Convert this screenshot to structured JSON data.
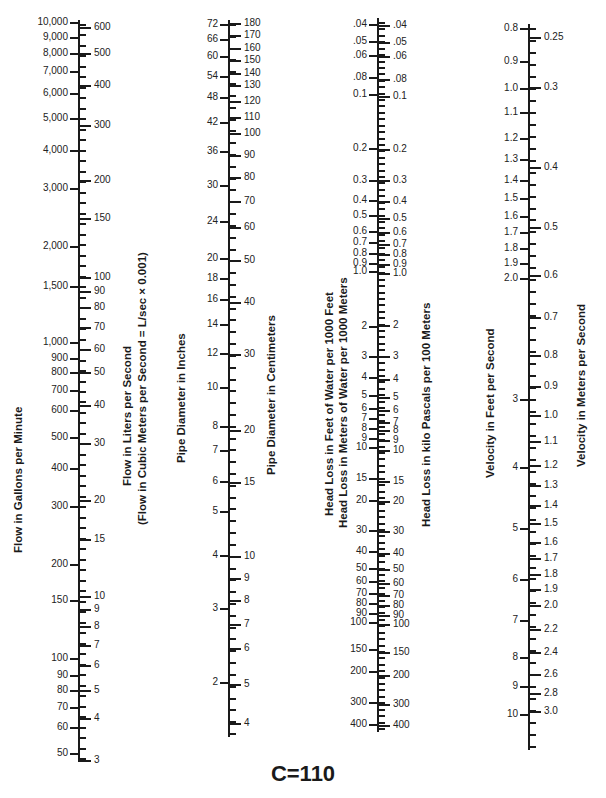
{
  "title": "C=110",
  "axes": [
    {
      "id": "flow",
      "x": 79,
      "top": 20,
      "bottom": 762,
      "left_title": "Flow in Gallons per Minute",
      "right_title": [
        "Flow in Liters per Second",
        "(Flow in Cubic Meters per Second = L/sec × 0.001)"
      ],
      "left_labels": [
        {
          "t": "10,000",
          "y": 22
        },
        {
          "t": "9,000",
          "y": 37
        },
        {
          "t": "8,000",
          "y": 53
        },
        {
          "t": "7,000",
          "y": 71
        },
        {
          "t": "6,000",
          "y": 93
        },
        {
          "t": "5,000",
          "y": 118
        },
        {
          "t": "4,000",
          "y": 150
        },
        {
          "t": "3,000",
          "y": 188
        },
        {
          "t": "2,000",
          "y": 246
        },
        {
          "t": "1,500",
          "y": 286
        },
        {
          "t": "1,000",
          "y": 342
        },
        {
          "t": "900",
          "y": 358
        },
        {
          "t": "800",
          "y": 372
        },
        {
          "t": "700",
          "y": 390
        },
        {
          "t": "600",
          "y": 410
        },
        {
          "t": "500",
          "y": 437
        },
        {
          "t": "400",
          "y": 468
        },
        {
          "t": "300",
          "y": 506
        },
        {
          "t": "200",
          "y": 564
        },
        {
          "t": "150",
          "y": 600
        },
        {
          "t": "100",
          "y": 658
        },
        {
          "t": "90",
          "y": 675
        },
        {
          "t": "80",
          "y": 690
        },
        {
          "t": "70",
          "y": 707
        },
        {
          "t": "60",
          "y": 727
        },
        {
          "t": "50",
          "y": 753
        }
      ],
      "right_labels": [
        {
          "t": "600",
          "y": 27
        },
        {
          "t": "500",
          "y": 53
        },
        {
          "t": "400",
          "y": 85
        },
        {
          "t": "300",
          "y": 125
        },
        {
          "t": "200",
          "y": 180
        },
        {
          "t": "150",
          "y": 218
        },
        {
          "t": "100",
          "y": 277
        },
        {
          "t": "90",
          "y": 291
        },
        {
          "t": "80",
          "y": 307
        },
        {
          "t": "70",
          "y": 327
        },
        {
          "t": "60",
          "y": 349
        },
        {
          "t": "50",
          "y": 372
        },
        {
          "t": "40",
          "y": 405
        },
        {
          "t": "30",
          "y": 443
        },
        {
          "t": "20",
          "y": 500
        },
        {
          "t": "15",
          "y": 539
        },
        {
          "t": "10",
          "y": 596
        },
        {
          "t": "9",
          "y": 609
        },
        {
          "t": "8",
          "y": 626
        },
        {
          "t": "7",
          "y": 645
        },
        {
          "t": "6",
          "y": 665
        },
        {
          "t": "5",
          "y": 690
        },
        {
          "t": "4",
          "y": 718
        },
        {
          "t": "3",
          "y": 760
        }
      ],
      "minor_ticks": 70
    },
    {
      "id": "pipe",
      "x": 229,
      "top": 20,
      "bottom": 737,
      "left_title": "Pipe Diameter in Inches",
      "right_title": [
        "Pipe Diameter in Centimeters"
      ],
      "left_labels": [
        {
          "t": "72",
          "y": 24
        },
        {
          "t": "66",
          "y": 39
        },
        {
          "t": "60",
          "y": 56
        },
        {
          "t": "54",
          "y": 76
        },
        {
          "t": "48",
          "y": 97
        },
        {
          "t": "42",
          "y": 122
        },
        {
          "t": "36",
          "y": 151
        },
        {
          "t": "30",
          "y": 185
        },
        {
          "t": "24",
          "y": 221
        },
        {
          "t": "20",
          "y": 258
        },
        {
          "t": "18",
          "y": 278
        },
        {
          "t": "16",
          "y": 299
        },
        {
          "t": "14",
          "y": 324
        },
        {
          "t": "12",
          "y": 353
        },
        {
          "t": "10",
          "y": 387
        },
        {
          "t": "8",
          "y": 426
        },
        {
          "t": "7",
          "y": 450
        },
        {
          "t": "6",
          "y": 481
        },
        {
          "t": "5",
          "y": 511
        },
        {
          "t": "4",
          "y": 555
        },
        {
          "t": "3",
          "y": 608
        },
        {
          "t": "2",
          "y": 682
        }
      ],
      "right_labels": [
        {
          "t": "180",
          "y": 23
        },
        {
          "t": "170",
          "y": 35
        },
        {
          "t": "160",
          "y": 48
        },
        {
          "t": "150",
          "y": 60
        },
        {
          "t": "140",
          "y": 73
        },
        {
          "t": "130",
          "y": 85
        },
        {
          "t": "120",
          "y": 101
        },
        {
          "t": "110",
          "y": 117
        },
        {
          "t": "100",
          "y": 133
        },
        {
          "t": "90",
          "y": 155
        },
        {
          "t": "80",
          "y": 177
        },
        {
          "t": "70",
          "y": 201
        },
        {
          "t": "60",
          "y": 227
        },
        {
          "t": "50",
          "y": 260
        },
        {
          "t": "40",
          "y": 302
        },
        {
          "t": "30",
          "y": 354
        },
        {
          "t": "20",
          "y": 430
        },
        {
          "t": "15",
          "y": 482
        },
        {
          "t": "10",
          "y": 556
        },
        {
          "t": "9",
          "y": 578
        },
        {
          "t": "8",
          "y": 600
        },
        {
          "t": "7",
          "y": 624
        },
        {
          "t": "6",
          "y": 648
        },
        {
          "t": "5",
          "y": 684
        },
        {
          "t": "4",
          "y": 723
        }
      ],
      "minor_ticks": 60
    },
    {
      "id": "headloss",
      "x": 378,
      "top": 18,
      "bottom": 732,
      "left_title": [
        "Head Loss in Feet of Water per 1000 Feet",
        "Head Loss in Meters of Water per 1000 Meters"
      ],
      "right_title": [
        "Head Loss in kilo Pascals per 100 Meters"
      ],
      "left_labels": [
        {
          "t": ".04",
          "y": 24
        },
        {
          "t": ".05",
          "y": 41
        },
        {
          "t": ".06",
          "y": 55
        },
        {
          "t": ".08",
          "y": 77
        },
        {
          "t": "0.1",
          "y": 94
        },
        {
          "t": "0.2",
          "y": 148
        },
        {
          "t": "0.3",
          "y": 180
        },
        {
          "t": "0.4",
          "y": 200
        },
        {
          "t": "0.5",
          "y": 215
        },
        {
          "t": "0.6",
          "y": 231
        },
        {
          "t": "0.7",
          "y": 242
        },
        {
          "t": "0.8",
          "y": 253
        },
        {
          "t": "0.9",
          "y": 263
        },
        {
          "t": "1.0",
          "y": 271
        },
        {
          "t": "2",
          "y": 326
        },
        {
          "t": "3",
          "y": 356
        },
        {
          "t": "4",
          "y": 377
        },
        {
          "t": "5",
          "y": 395
        },
        {
          "t": "6",
          "y": 408
        },
        {
          "t": "7",
          "y": 418
        },
        {
          "t": "8",
          "y": 428
        },
        {
          "t": "9",
          "y": 438
        },
        {
          "t": "10",
          "y": 447
        },
        {
          "t": "15",
          "y": 478
        },
        {
          "t": "20",
          "y": 500
        },
        {
          "t": "30",
          "y": 530
        },
        {
          "t": "40",
          "y": 551
        },
        {
          "t": "50",
          "y": 568
        },
        {
          "t": "60",
          "y": 581
        },
        {
          "t": "70",
          "y": 593
        },
        {
          "t": "80",
          "y": 603
        },
        {
          "t": "90",
          "y": 613
        },
        {
          "t": "100",
          "y": 622
        },
        {
          "t": "150",
          "y": 649
        },
        {
          "t": "200",
          "y": 671
        },
        {
          "t": "300",
          "y": 702
        },
        {
          "t": "400",
          "y": 724
        }
      ],
      "right_labels": [
        {
          "t": ".04",
          "y": 25
        },
        {
          "t": ".05",
          "y": 42
        },
        {
          "t": ".06",
          "y": 56
        },
        {
          "t": ".08",
          "y": 79
        },
        {
          "t": "0.1",
          "y": 96
        },
        {
          "t": "0.2",
          "y": 149
        },
        {
          "t": "0.3",
          "y": 180
        },
        {
          "t": "0.4",
          "y": 201
        },
        {
          "t": "0.5",
          "y": 218
        },
        {
          "t": "0.6",
          "y": 232
        },
        {
          "t": "0.7",
          "y": 244
        },
        {
          "t": "0.8",
          "y": 254
        },
        {
          "t": "0.9",
          "y": 264
        },
        {
          "t": "1.0",
          "y": 273
        },
        {
          "t": "2",
          "y": 325
        },
        {
          "t": "3",
          "y": 356
        },
        {
          "t": "4",
          "y": 379
        },
        {
          "t": "5",
          "y": 397
        },
        {
          "t": "6",
          "y": 410
        },
        {
          "t": "7",
          "y": 422
        },
        {
          "t": "8",
          "y": 430
        },
        {
          "t": "9",
          "y": 440
        },
        {
          "t": "10",
          "y": 450
        },
        {
          "t": "15",
          "y": 481
        },
        {
          "t": "20",
          "y": 501
        },
        {
          "t": "30",
          "y": 531
        },
        {
          "t": "40",
          "y": 553
        },
        {
          "t": "50",
          "y": 569
        },
        {
          "t": "60",
          "y": 583
        },
        {
          "t": "70",
          "y": 595
        },
        {
          "t": "80",
          "y": 605
        },
        {
          "t": "90",
          "y": 615
        },
        {
          "t": "100",
          "y": 624
        },
        {
          "t": "150",
          "y": 652
        },
        {
          "t": "200",
          "y": 675
        },
        {
          "t": "300",
          "y": 704
        },
        {
          "t": "400",
          "y": 725
        }
      ],
      "minor_ticks": 110
    },
    {
      "id": "velocity",
      "x": 529,
      "top": 24,
      "bottom": 750,
      "left_title": "Velocity in Feet per Second",
      "right_title": [
        "Velocity in Meters per Second"
      ],
      "left_labels": [
        {
          "t": "0.8",
          "y": 28
        },
        {
          "t": "0.9",
          "y": 61
        },
        {
          "t": "1.0",
          "y": 88
        },
        {
          "t": "1.1",
          "y": 112
        },
        {
          "t": "1.2",
          "y": 138
        },
        {
          "t": "1.3",
          "y": 159
        },
        {
          "t": "1.4",
          "y": 180
        },
        {
          "t": "1.5",
          "y": 198
        },
        {
          "t": "1.6",
          "y": 216
        },
        {
          "t": "1.7",
          "y": 232
        },
        {
          "t": "1.8",
          "y": 248
        },
        {
          "t": "1.9",
          "y": 263
        },
        {
          "t": "2.0",
          "y": 278
        },
        {
          "t": "3",
          "y": 399
        },
        {
          "t": "4",
          "y": 467
        },
        {
          "t": "5",
          "y": 528
        },
        {
          "t": "6",
          "y": 579
        },
        {
          "t": "7",
          "y": 620
        },
        {
          "t": "8",
          "y": 657
        },
        {
          "t": "9",
          "y": 686
        },
        {
          "t": "10",
          "y": 714
        }
      ],
      "right_labels": [
        {
          "t": "0.25",
          "y": 37
        },
        {
          "t": "0.3",
          "y": 87
        },
        {
          "t": "0.4",
          "y": 167
        },
        {
          "t": "0.5",
          "y": 227
        },
        {
          "t": "0.6",
          "y": 275
        },
        {
          "t": "0.7",
          "y": 317
        },
        {
          "t": "0.8",
          "y": 355
        },
        {
          "t": "0.9",
          "y": 386
        },
        {
          "t": "1.0",
          "y": 415
        },
        {
          "t": "1.1",
          "y": 441
        },
        {
          "t": "1.2",
          "y": 465
        },
        {
          "t": "1.3",
          "y": 485
        },
        {
          "t": "1.4",
          "y": 505
        },
        {
          "t": "1.5",
          "y": 523
        },
        {
          "t": "1.6",
          "y": 542
        },
        {
          "t": "1.7",
          "y": 558
        },
        {
          "t": "1.8",
          "y": 574
        },
        {
          "t": "1.9",
          "y": 589
        },
        {
          "t": "2.0",
          "y": 605
        },
        {
          "t": "2.2",
          "y": 629
        },
        {
          "t": "2.4",
          "y": 652
        },
        {
          "t": "2.6",
          "y": 674
        },
        {
          "t": "2.8",
          "y": 693
        },
        {
          "t": "3.0",
          "y": 711
        }
      ],
      "minor_ticks": 60
    }
  ],
  "titles": {
    "flow_gpm": "Flow in Gallons per Minute",
    "flow_lps": "Flow in Liters per Second",
    "flow_cms": "(Flow in Cubic Meters per Second = L/sec × 0.001)",
    "pipe_in": "Pipe Diameter in Inches",
    "pipe_cm": "Pipe Diameter in Centimeters",
    "head_ft": "Head Loss in Feet of Water per 1000 Feet",
    "head_m": "Head Loss in Meters of Water per 1000 Meters",
    "head_kpa": "Head Loss in kilo Pascals per 100 Meters",
    "vel_fps": "Velocity in Feet per Second",
    "vel_mps": "Velocity in Meters per Second"
  }
}
